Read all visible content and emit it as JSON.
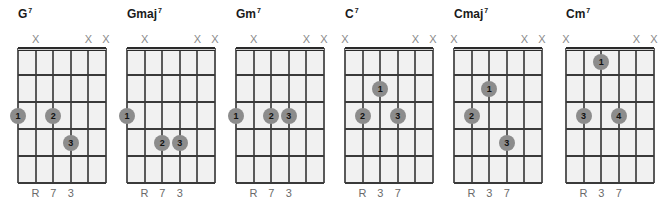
{
  "diagram": {
    "type": "guitar-chord-diagrams",
    "strings": 6,
    "frets_shown": 5,
    "string_spacing_px": 17.6,
    "fret_spacing_px": 27,
    "colors": {
      "background": "#ffffff",
      "fretboard": "#f1f1f1",
      "lines": "#3a3a3a",
      "dot": "#8c8c8c",
      "dot_text": "#111111",
      "mute_mark": "#8a8a8a",
      "interval_text": "#6a6a6a",
      "title": "#1a1a1a"
    },
    "mute_symbol": "X",
    "chords": [
      {
        "name": "G",
        "quality": "7",
        "x": 18,
        "muted_strings": [
          2,
          5,
          6
        ],
        "dots": [
          {
            "string": 1,
            "fret": 3,
            "finger": "1"
          },
          {
            "string": 3,
            "fret": 3,
            "finger": "2"
          },
          {
            "string": 4,
            "fret": 4,
            "finger": "3"
          }
        ],
        "intervals": [
          {
            "string": 2,
            "label": "R"
          },
          {
            "string": 3,
            "label": "7"
          },
          {
            "string": 4,
            "label": "3"
          }
        ]
      },
      {
        "name": "Gmaj",
        "quality": "7",
        "x": 127,
        "muted_strings": [
          2,
          5,
          6
        ],
        "dots": [
          {
            "string": 1,
            "fret": 3,
            "finger": "1"
          },
          {
            "string": 3,
            "fret": 4,
            "finger": "2"
          },
          {
            "string": 4,
            "fret": 4,
            "finger": "3"
          }
        ],
        "intervals": [
          {
            "string": 2,
            "label": "R"
          },
          {
            "string": 3,
            "label": "7"
          },
          {
            "string": 4,
            "label": "3"
          }
        ]
      },
      {
        "name": "Gm",
        "quality": "7",
        "x": 236,
        "muted_strings": [
          2,
          5,
          6
        ],
        "dots": [
          {
            "string": 1,
            "fret": 3,
            "finger": "1"
          },
          {
            "string": 3,
            "fret": 3,
            "finger": "2"
          },
          {
            "string": 4,
            "fret": 3,
            "finger": "3"
          }
        ],
        "intervals": [
          {
            "string": 2,
            "label": "R"
          },
          {
            "string": 3,
            "label": "7"
          },
          {
            "string": 4,
            "label": "3"
          }
        ]
      },
      {
        "name": "C",
        "quality": "7",
        "x": 345,
        "muted_strings": [
          1,
          5,
          6
        ],
        "dots": [
          {
            "string": 3,
            "fret": 2,
            "finger": "1"
          },
          {
            "string": 2,
            "fret": 3,
            "finger": "2"
          },
          {
            "string": 4,
            "fret": 3,
            "finger": "3"
          }
        ],
        "intervals": [
          {
            "string": 2,
            "label": "R"
          },
          {
            "string": 3,
            "label": "3"
          },
          {
            "string": 4,
            "label": "7"
          }
        ]
      },
      {
        "name": "Cmaj",
        "quality": "7",
        "x": 454,
        "muted_strings": [
          1,
          5,
          6
        ],
        "dots": [
          {
            "string": 3,
            "fret": 2,
            "finger": "1"
          },
          {
            "string": 2,
            "fret": 3,
            "finger": "2"
          },
          {
            "string": 4,
            "fret": 4,
            "finger": "3"
          }
        ],
        "intervals": [
          {
            "string": 2,
            "label": "R"
          },
          {
            "string": 3,
            "label": "3"
          },
          {
            "string": 4,
            "label": "7"
          }
        ]
      },
      {
        "name": "Cm",
        "quality": "7",
        "x": 566,
        "muted_strings": [
          1,
          5,
          6
        ],
        "dots": [
          {
            "string": 3,
            "fret": 1,
            "finger": "1"
          },
          {
            "string": 2,
            "fret": 3,
            "finger": "3"
          },
          {
            "string": 4,
            "fret": 3,
            "finger": "4"
          }
        ],
        "intervals": [
          {
            "string": 2,
            "label": "R"
          },
          {
            "string": 3,
            "label": "3"
          },
          {
            "string": 4,
            "label": "7"
          }
        ]
      }
    ]
  }
}
